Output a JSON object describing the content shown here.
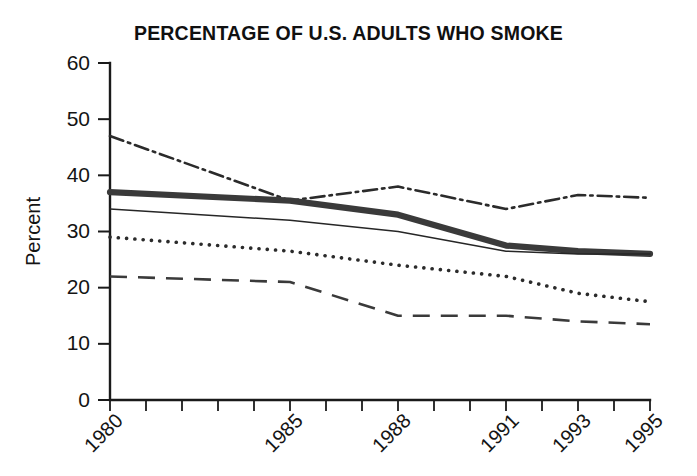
{
  "chart_data": {
    "type": "line",
    "title": "PERCENTAGE OF U.S. ADULTS WHO SMOKE",
    "xlabel": "",
    "ylabel": "Percent",
    "x": [
      1980,
      1985,
      1988,
      1991,
      1993,
      1995
    ],
    "xtick_labels": [
      "1980",
      "1985",
      "1988",
      "1991",
      "1993",
      "1995"
    ],
    "ytick_labels": [
      "0",
      "10",
      "20",
      "30",
      "40",
      "50",
      "60"
    ],
    "yticks": [
      0,
      10,
      20,
      30,
      40,
      50,
      60
    ],
    "ylim": [
      0,
      60
    ],
    "xlim": [
      1980,
      1995
    ],
    "grid": false,
    "legend": "none",
    "series": [
      {
        "name": "dash-dot-series",
        "style": "dash-dot",
        "values": [
          47,
          35.5,
          38,
          34,
          36.5,
          36
        ]
      },
      {
        "name": "thick-solid-series",
        "style": "thick-solid",
        "values": [
          37,
          35.5,
          33,
          27.5,
          26.5,
          26
        ]
      },
      {
        "name": "thin-solid-series",
        "style": "thin-solid",
        "values": [
          34,
          32,
          30,
          26.5,
          26,
          26
        ]
      },
      {
        "name": "dotted-series",
        "style": "dotted",
        "values": [
          29,
          26.5,
          24,
          22,
          19,
          17.5
        ]
      },
      {
        "name": "dashed-series",
        "style": "dashed",
        "values": [
          22,
          21,
          15,
          15,
          14,
          13.5
        ]
      }
    ]
  }
}
